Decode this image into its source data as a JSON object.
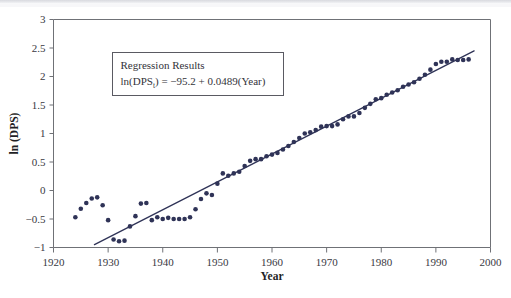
{
  "figure": {
    "name": "ln-dps-vs-year-scatter",
    "background_color": "#ffffff",
    "ink_color": "#2f3357",
    "axis_color": "#6f7176"
  },
  "annotation": {
    "title": "Regression Results",
    "equation_prefix": "ln(DPS",
    "equation_subscript": "t",
    "equation_suffix": ") = −95.2 + 0.0489(Year)",
    "equation_full": "ln(DPSt) = −95.2 + 0.0489(Year)",
    "intercept": -95.2,
    "slope": 0.0489,
    "box_border_color": "#5a5a62"
  },
  "chart_data": {
    "type": "scatter",
    "title": "",
    "xlabel": "Year",
    "ylabel": "ln (DPS)",
    "xlim": [
      1920,
      2000
    ],
    "ylim": [
      -1,
      3
    ],
    "xticks": [
      1920,
      1930,
      1940,
      1950,
      1960,
      1970,
      1980,
      1990,
      2000
    ],
    "xtick_labels": [
      "1920",
      "1930",
      "1940",
      "1950",
      "1960",
      "1970",
      "1980",
      "1990",
      "2000"
    ],
    "yticks": [
      -1,
      -0.5,
      0,
      0.5,
      1,
      1.5,
      2,
      2.5,
      3
    ],
    "ytick_labels": [
      "−1",
      "−0.5",
      "0",
      "0.5",
      "1",
      "1.5",
      "2",
      "2.5",
      "3"
    ],
    "grid": false,
    "legend": null,
    "marker": "filled-circle",
    "marker_color": "#2f3357",
    "marker_size_px": 3.4,
    "series": [
      {
        "name": "ln(DPS)",
        "x": [
          1924,
          1925,
          1926,
          1927,
          1928,
          1929,
          1930,
          1931,
          1932,
          1933,
          1934,
          1935,
          1936,
          1937,
          1938,
          1939,
          1940,
          1941,
          1942,
          1943,
          1944,
          1945,
          1946,
          1947,
          1948,
          1949,
          1950,
          1951,
          1952,
          1953,
          1954,
          1955,
          1956,
          1957,
          1958,
          1959,
          1960,
          1961,
          1962,
          1963,
          1964,
          1965,
          1966,
          1967,
          1968,
          1969,
          1970,
          1971,
          1972,
          1973,
          1974,
          1975,
          1976,
          1977,
          1978,
          1979,
          1980,
          1981,
          1982,
          1983,
          1984,
          1985,
          1986,
          1987,
          1988,
          1989,
          1990,
          1991,
          1992,
          1993,
          1994,
          1995,
          1996
        ],
        "y": [
          -0.47,
          -0.32,
          -0.22,
          -0.14,
          -0.12,
          -0.26,
          -0.52,
          -0.86,
          -0.89,
          -0.88,
          -0.63,
          -0.45,
          -0.23,
          -0.22,
          -0.52,
          -0.47,
          -0.5,
          -0.48,
          -0.5,
          -0.5,
          -0.5,
          -0.47,
          -0.33,
          -0.15,
          -0.05,
          -0.08,
          0.12,
          0.3,
          0.26,
          0.3,
          0.33,
          0.43,
          0.52,
          0.55,
          0.55,
          0.6,
          0.63,
          0.66,
          0.72,
          0.78,
          0.85,
          0.92,
          1.0,
          1.02,
          1.06,
          1.12,
          1.13,
          1.13,
          1.16,
          1.25,
          1.3,
          1.3,
          1.36,
          1.45,
          1.52,
          1.6,
          1.62,
          1.68,
          1.72,
          1.76,
          1.82,
          1.86,
          1.9,
          1.96,
          2.03,
          2.12,
          2.22,
          2.26,
          2.26,
          2.3,
          2.29,
          2.29,
          2.3
        ]
      }
    ],
    "fit_line": {
      "name": "regression-line",
      "color": "#2f3357",
      "x_start": 1927.5,
      "x_end": 1997,
      "y_start": -0.95,
      "y_end": 2.45
    }
  }
}
